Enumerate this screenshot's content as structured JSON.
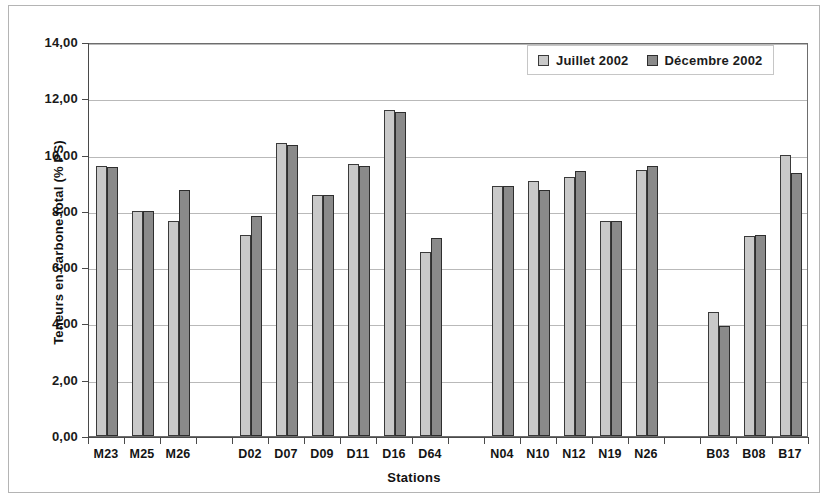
{
  "chart_data": {
    "type": "bar",
    "title": "",
    "xlabel": "Stations",
    "ylabel": "Teneurs en carbone total (% PS)",
    "ylim": [
      0,
      14
    ],
    "ytick_step": 2,
    "ytick_labels": [
      "0,00",
      "2,00",
      "4,00",
      "6,00",
      "8,00",
      "10,00",
      "12,00",
      "14,00"
    ],
    "grid": true,
    "legend_position": "top-right",
    "categories": [
      "M23",
      "M25",
      "M26",
      "",
      "D02",
      "D07",
      "D09",
      "D11",
      "D16",
      "D64",
      "",
      "N04",
      "N10",
      "N12",
      "N19",
      "N26",
      "",
      "B03",
      "B08",
      "B17"
    ],
    "series": [
      {
        "name": "Juillet 2002",
        "color": "#c9c9c9",
        "values": [
          9.6,
          8.0,
          7.65,
          null,
          7.15,
          10.4,
          8.55,
          9.65,
          11.6,
          6.55,
          null,
          8.9,
          9.05,
          9.2,
          7.65,
          9.45,
          null,
          4.4,
          7.1,
          10.0
        ]
      },
      {
        "name": "Décembre 2002",
        "color": "#8a8a8a",
        "values": [
          9.55,
          8.0,
          8.75,
          null,
          7.8,
          10.35,
          8.55,
          9.6,
          11.5,
          7.05,
          null,
          8.9,
          8.75,
          9.4,
          7.65,
          9.6,
          null,
          3.9,
          7.15,
          9.35
        ]
      }
    ]
  },
  "legend": {
    "items": [
      {
        "label": "Juillet 2002"
      },
      {
        "label": "Décembre 2002"
      }
    ]
  }
}
